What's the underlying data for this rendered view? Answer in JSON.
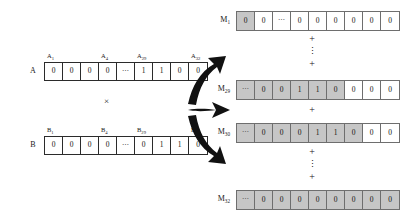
{
  "diagram": {
    "operator": "×",
    "plus": "+",
    "vdots": "⋮",
    "ellipsis": "⋯",
    "colors": {
      "gray_fill": "#c6c6c6",
      "white_fill": "#ffffff",
      "border": "#2b2b2b",
      "m_border": "#6e6e6e",
      "arrow": "#111111"
    }
  },
  "operands": {
    "a": {
      "name": "A",
      "labels": [
        {
          "text": "A",
          "sub": "1"
        },
        {
          "text": "A",
          "sub": "4"
        },
        {
          "text": "A",
          "sub": "29"
        },
        {
          "text": "A",
          "sub": "32"
        }
      ],
      "cells": [
        {
          "value": "0",
          "shaded": false,
          "dots": false
        },
        {
          "value": "0",
          "shaded": false,
          "dots": false
        },
        {
          "value": "0",
          "shaded": false,
          "dots": false
        },
        {
          "value": "0",
          "shaded": false,
          "dots": false
        },
        {
          "value": "⋯",
          "shaded": false,
          "dots": true
        },
        {
          "value": "1",
          "shaded": false,
          "dots": false
        },
        {
          "value": "1",
          "shaded": false,
          "dots": false
        },
        {
          "value": "0",
          "shaded": false,
          "dots": false
        },
        {
          "value": "0",
          "shaded": false,
          "dots": false
        }
      ]
    },
    "b": {
      "name": "B",
      "labels": [
        {
          "text": "B",
          "sub": "1"
        },
        {
          "text": "B",
          "sub": "4"
        },
        {
          "text": "B",
          "sub": "29"
        },
        {
          "text": "B",
          "sub": "32"
        }
      ],
      "cells": [
        {
          "value": "0",
          "shaded": false,
          "dots": false
        },
        {
          "value": "0",
          "shaded": false,
          "dots": false
        },
        {
          "value": "0",
          "shaded": false,
          "dots": false
        },
        {
          "value": "0",
          "shaded": false,
          "dots": false
        },
        {
          "value": "⋯",
          "shaded": false,
          "dots": true
        },
        {
          "value": "0",
          "shaded": false,
          "dots": false
        },
        {
          "value": "1",
          "shaded": false,
          "dots": false
        },
        {
          "value": "1",
          "shaded": false,
          "dots": false
        },
        {
          "value": "0",
          "shaded": false,
          "dots": false
        }
      ]
    }
  },
  "products": [
    {
      "name": "M",
      "sub": "1",
      "cells": [
        {
          "value": "0",
          "shaded": true,
          "dots": false
        },
        {
          "value": "0",
          "shaded": false,
          "dots": false
        },
        {
          "value": "⋯",
          "shaded": false,
          "dots": true
        },
        {
          "value": "0",
          "shaded": false,
          "dots": false
        },
        {
          "value": "0",
          "shaded": false,
          "dots": false
        },
        {
          "value": "0",
          "shaded": false,
          "dots": false
        },
        {
          "value": "0",
          "shaded": false,
          "dots": false
        },
        {
          "value": "0",
          "shaded": false,
          "dots": false
        },
        {
          "value": "0",
          "shaded": false,
          "dots": false
        }
      ]
    },
    {
      "name": "M",
      "sub": "29",
      "cells": [
        {
          "value": "⋯",
          "shaded": true,
          "dots": true
        },
        {
          "value": "0",
          "shaded": true,
          "dots": false
        },
        {
          "value": "0",
          "shaded": true,
          "dots": false
        },
        {
          "value": "1",
          "shaded": true,
          "dots": false
        },
        {
          "value": "1",
          "shaded": true,
          "dots": false
        },
        {
          "value": "0",
          "shaded": true,
          "dots": false
        },
        {
          "value": "0",
          "shaded": false,
          "dots": false
        },
        {
          "value": "0",
          "shaded": false,
          "dots": false
        },
        {
          "value": "0",
          "shaded": false,
          "dots": false
        }
      ]
    },
    {
      "name": "M",
      "sub": "30",
      "cells": [
        {
          "value": "⋯",
          "shaded": true,
          "dots": true
        },
        {
          "value": "0",
          "shaded": true,
          "dots": false
        },
        {
          "value": "0",
          "shaded": true,
          "dots": false
        },
        {
          "value": "0",
          "shaded": true,
          "dots": false
        },
        {
          "value": "1",
          "shaded": true,
          "dots": false
        },
        {
          "value": "1",
          "shaded": true,
          "dots": false
        },
        {
          "value": "0",
          "shaded": true,
          "dots": false
        },
        {
          "value": "0",
          "shaded": false,
          "dots": false
        },
        {
          "value": "0",
          "shaded": false,
          "dots": false
        }
      ]
    },
    {
      "name": "M",
      "sub": "32",
      "cells": [
        {
          "value": "⋯",
          "shaded": true,
          "dots": true
        },
        {
          "value": "0",
          "shaded": true,
          "dots": false
        },
        {
          "value": "0",
          "shaded": true,
          "dots": false
        },
        {
          "value": "0",
          "shaded": true,
          "dots": false
        },
        {
          "value": "0",
          "shaded": true,
          "dots": false
        },
        {
          "value": "0",
          "shaded": true,
          "dots": false
        },
        {
          "value": "0",
          "shaded": true,
          "dots": false
        },
        {
          "value": "0",
          "shaded": true,
          "dots": false
        },
        {
          "value": "0",
          "shaded": true,
          "dots": false
        }
      ]
    }
  ],
  "separators": [
    {
      "id": "sep-1",
      "symbols": [
        "+",
        "⋮",
        "+"
      ]
    },
    {
      "id": "sep-2",
      "symbols": [
        "+"
      ]
    },
    {
      "id": "sep-3",
      "symbols": [
        "+",
        "⋮",
        "+"
      ]
    }
  ],
  "arrow_targets": [
    "M29",
    "M30",
    "M32"
  ]
}
